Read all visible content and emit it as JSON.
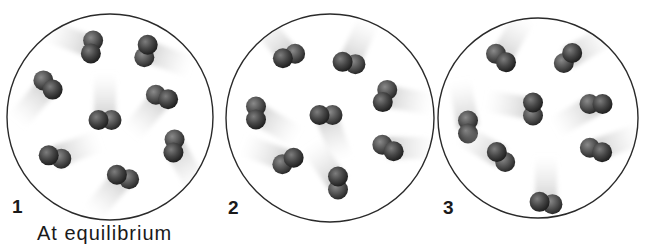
{
  "diagram": {
    "type": "molecular-equilibrium-snapshots",
    "caption": "At equilibrium",
    "panels": [
      {
        "label": "1",
        "circle": {
          "cx": 110,
          "cy": 117,
          "r": 103
        },
        "molecules": [
          {
            "x": 92,
            "y": 47,
            "angle": 100,
            "trail": 200
          },
          {
            "x": 146,
            "y": 51,
            "angle": 105,
            "trail": 20
          },
          {
            "x": 48,
            "y": 85,
            "angle": 45,
            "trail": 130
          },
          {
            "x": 105,
            "y": 120,
            "angle": 0,
            "trail": 270
          },
          {
            "x": 162,
            "y": 97,
            "angle": 20,
            "trail": 130
          },
          {
            "x": 55,
            "y": 157,
            "angle": 15,
            "trail": 340
          },
          {
            "x": 174,
            "y": 146,
            "angle": 95,
            "trail": 60
          },
          {
            "x": 123,
            "y": 177,
            "angle": 20,
            "trail": 130
          }
        ]
      },
      {
        "label": "2",
        "circle": {
          "cx": 330,
          "cy": 118,
          "r": 104
        },
        "molecules": [
          {
            "x": 289,
            "y": 56,
            "angle": 160,
            "trail": 230
          },
          {
            "x": 349,
            "y": 63,
            "angle": 10,
            "trail": 295
          },
          {
            "x": 256,
            "y": 113,
            "angle": 90,
            "trail": 30
          },
          {
            "x": 326,
            "y": 115,
            "angle": 0,
            "trail": 70
          },
          {
            "x": 385,
            "y": 96,
            "angle": 110,
            "trail": 10
          },
          {
            "x": 288,
            "y": 161,
            "angle": 150,
            "trail": 200
          },
          {
            "x": 388,
            "y": 148,
            "angle": 30,
            "trail": 0
          },
          {
            "x": 338,
            "y": 183,
            "angle": 90,
            "trail": 235
          }
        ]
      },
      {
        "label": "3",
        "circle": {
          "cx": 538,
          "cy": 118,
          "r": 100
        },
        "molecules": [
          {
            "x": 501,
            "y": 58,
            "angle": 40,
            "trail": 300
          },
          {
            "x": 568,
            "y": 58,
            "angle": 130,
            "trail": 330
          },
          {
            "x": 468,
            "y": 127,
            "angle": 90,
            "trail": 260
          },
          {
            "x": 533,
            "y": 109,
            "angle": 90,
            "trail": 190
          },
          {
            "x": 596,
            "y": 104,
            "angle": 0,
            "trail": 150
          },
          {
            "x": 501,
            "y": 157,
            "angle": 50,
            "trail": 210
          },
          {
            "x": 596,
            "y": 150,
            "angle": 20,
            "trail": 340
          },
          {
            "x": 546,
            "y": 203,
            "angle": 10,
            "trail": 270
          }
        ]
      }
    ]
  },
  "colors": {
    "circle_outline": "#2a2a2a",
    "atom_dark": "#2e2e2e",
    "atom_light": "#6a6a6a",
    "trail": "#b8b8b8",
    "text": "#1a1a1a"
  }
}
